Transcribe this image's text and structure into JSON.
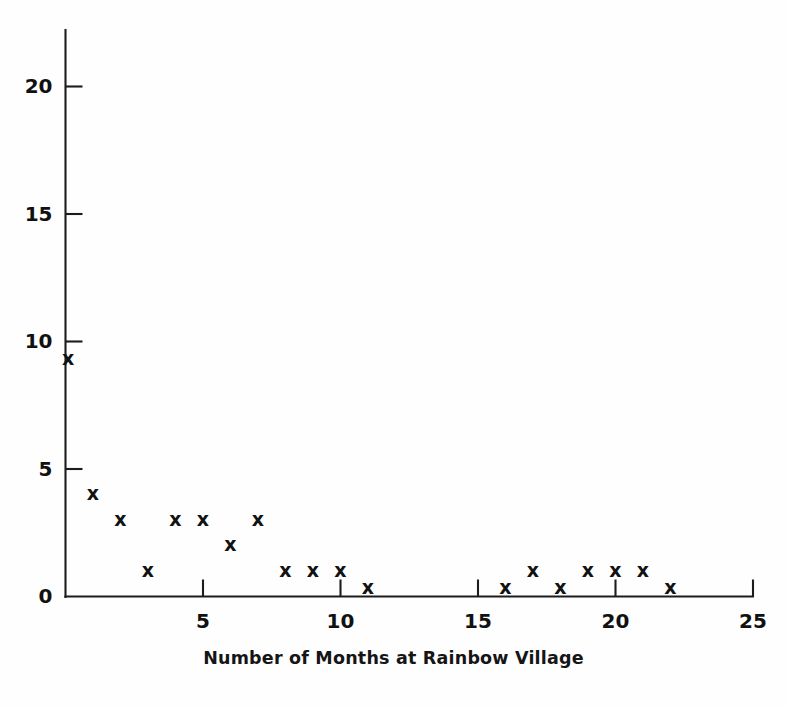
{
  "chart_data": {
    "type": "scatter",
    "title": "",
    "xlabel": "Number of Months at Rainbow Village",
    "ylabel": "",
    "xlim": [
      0,
      25
    ],
    "ylim": [
      0,
      21.5
    ],
    "xticks": [
      5,
      10,
      15,
      20,
      25
    ],
    "yticks": [
      0,
      5,
      10,
      15,
      20
    ],
    "xtick_labels": [
      "5",
      "10",
      "15",
      "20",
      "25"
    ],
    "ytick_labels": [
      "0",
      "5",
      "10",
      "15",
      "20"
    ],
    "grid": false,
    "legend": null,
    "marker": "x",
    "marker_color": "#121212",
    "points": [
      {
        "x": 0.1,
        "y": 9.3
      },
      {
        "x": 1,
        "y": 4
      },
      {
        "x": 2,
        "y": 3
      },
      {
        "x": 3,
        "y": 1
      },
      {
        "x": 4,
        "y": 3
      },
      {
        "x": 5,
        "y": 3
      },
      {
        "x": 6,
        "y": 2
      },
      {
        "x": 7,
        "y": 3
      },
      {
        "x": 8,
        "y": 1
      },
      {
        "x": 9,
        "y": 1
      },
      {
        "x": 10,
        "y": 1
      },
      {
        "x": 11,
        "y": 0.3
      },
      {
        "x": 16,
        "y": 0.3
      },
      {
        "x": 17,
        "y": 1
      },
      {
        "x": 18,
        "y": 0.3
      },
      {
        "x": 19,
        "y": 1
      },
      {
        "x": 20,
        "y": 1
      },
      {
        "x": 21,
        "y": 1
      },
      {
        "x": 22,
        "y": 0.3
      }
    ]
  },
  "axes": {
    "x_axis_label": "Number of Months at Rainbow Village",
    "marker_glyph": "x"
  }
}
